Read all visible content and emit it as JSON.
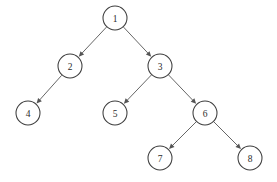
{
  "diagram": {
    "type": "directed-tree",
    "background_color": "#ffffff",
    "node_fill_color": "#ffffff",
    "node_stroke_color": "#3d3d3d",
    "edge_color": "#555555",
    "label_color": "#2b2b2b",
    "node_radius": 12,
    "canvas": {
      "width": 277,
      "height": 182
    },
    "nodes": [
      {
        "id": "1",
        "label": "1",
        "cx": 115,
        "cy": 18,
        "depth": 0
      },
      {
        "id": "2",
        "label": "2",
        "cx": 70,
        "cy": 66,
        "depth": 1
      },
      {
        "id": "3",
        "label": "3",
        "cx": 160,
        "cy": 66,
        "depth": 1
      },
      {
        "id": "4",
        "label": "4",
        "cx": 28,
        "cy": 113,
        "depth": 2
      },
      {
        "id": "5",
        "label": "5",
        "cx": 115,
        "cy": 113,
        "depth": 2
      },
      {
        "id": "6",
        "label": "6",
        "cx": 205,
        "cy": 113,
        "depth": 2
      },
      {
        "id": "7",
        "label": "7",
        "cx": 160,
        "cy": 158,
        "depth": 3
      },
      {
        "id": "8",
        "label": "8",
        "cx": 250,
        "cy": 158,
        "depth": 3
      }
    ],
    "edges": [
      {
        "from": "1",
        "to": "2",
        "side": "left",
        "directed": true
      },
      {
        "from": "1",
        "to": "3",
        "side": "right",
        "directed": true
      },
      {
        "from": "2",
        "to": "4",
        "side": "left",
        "directed": true
      },
      {
        "from": "3",
        "to": "5",
        "side": "left",
        "directed": true
      },
      {
        "from": "3",
        "to": "6",
        "side": "right",
        "directed": true
      },
      {
        "from": "6",
        "to": "7",
        "side": "left",
        "directed": true
      },
      {
        "from": "6",
        "to": "8",
        "side": "right",
        "directed": true
      }
    ]
  }
}
